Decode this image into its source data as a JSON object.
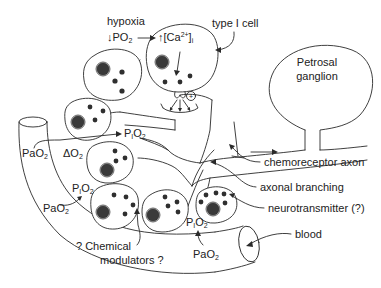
{
  "diagram": {
    "labels": {
      "hypoxia": "hypoxia",
      "po2_down": "↓PO",
      "po2_down_sub": "2",
      "ca_up": "↑[Ca",
      "ca_up_sup": "2+",
      "ca_up_close": "]",
      "ca_up_sub": "i",
      "type1_cell": "type I cell",
      "petrosal_line1": "Petrosal",
      "petrosal_line2": "ganglion",
      "plus_sign": "+",
      "pao2_left": "PaO",
      "pao2_left_sub": "2",
      "delta_o2": "ΔO",
      "delta_o2_sub": "2",
      "pio2_top": "P",
      "pio2_top_i": "I",
      "pio2_top_o": "O",
      "pio2_top_sub": "2",
      "pio2_left": "P",
      "pio2_left_i": "I",
      "pio2_left_o": "O",
      "pio2_left_sub": "2",
      "pao2_lower_left": "PaO",
      "pao2_lower_left_sub": "2",
      "pio2_bottom": "P",
      "pio2_bottom_i": "I",
      "pio2_bottom_o": "O",
      "pio2_bottom_sub": "2",
      "pao2_bottom": "PaO",
      "pao2_bottom_sub": "2",
      "chemoreceptor_axon": "chemoreceptor axon",
      "axonal_branching": "axonal branching",
      "neurotransmitter": "neurotransmitter (?)",
      "chemical_modulators_line1": "? Chemical",
      "chemical_modulators_line2": "modulators ?",
      "blood": "blood"
    },
    "colors": {
      "line": "#2a2a2a",
      "nucleus": "#3a3a3a",
      "background": "#ffffff"
    }
  }
}
